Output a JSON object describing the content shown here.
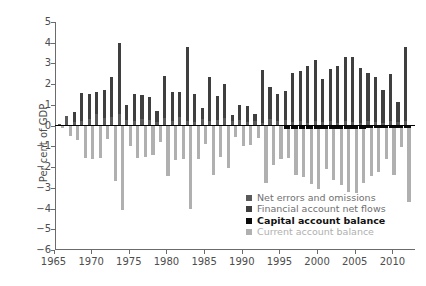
{
  "chart_data": {
    "type": "bar",
    "title": "",
    "xlabel": "",
    "ylabel": "Per cent of GDP",
    "ylim": [
      -6,
      5
    ],
    "xlim": [
      1965.2,
      2013.0
    ],
    "yticks": [
      5,
      4,
      3,
      2,
      1,
      0,
      -1,
      -2,
      -3,
      -4,
      -5,
      -6
    ],
    "ytick_labels": [
      "5",
      "4",
      "3",
      "2",
      "1",
      "0",
      "−1",
      "−2",
      "−3",
      "−4",
      "−5",
      "−6"
    ],
    "xticks": [
      1965,
      1970,
      1975,
      1980,
      1985,
      1990,
      1995,
      2000,
      2005,
      2010
    ],
    "xtick_labels": [
      "1965",
      "1970",
      "1975",
      "1980",
      "1985",
      "1990",
      "1995",
      "2000",
      "2005",
      "2010"
    ],
    "grid": false,
    "stacked": true,
    "legend_position": "lower right",
    "series": [
      {
        "name": "Net errors and omissions",
        "color": "#5a5a5a"
      },
      {
        "name": "Financial account net flows",
        "color": "#3f3f3f"
      },
      {
        "name": "Capital account balance",
        "color": "#0a0a0a"
      },
      {
        "name": "Current account balance",
        "color": "#b0b0b0"
      }
    ],
    "x": [
      1966,
      1967,
      1968,
      1969,
      1970,
      1971,
      1972,
      1973,
      1974,
      1975,
      1976,
      1977,
      1978,
      1979,
      1980,
      1981,
      1982,
      1983,
      1984,
      1985,
      1986,
      1987,
      1988,
      1989,
      1990,
      1991,
      1992,
      1993,
      1994,
      1995,
      1996,
      1997,
      1998,
      1999,
      2000,
      2001,
      2002,
      2003,
      2004,
      2005,
      2006,
      2007,
      2008,
      2009,
      2010,
      2011,
      2012
    ],
    "values": {
      "net_errors_and_omissions": [
        0.1,
        0.45,
        0.18,
        0.22,
        0.3,
        0.55,
        0.35,
        0.4,
        0.55,
        0.28,
        0.22,
        0.3,
        0.25,
        0.18,
        0.35,
        0.22,
        0.4,
        0.2,
        0.18,
        0.3,
        0.22,
        0.25,
        0.38,
        0.2,
        0.28,
        0.18,
        0.22,
        0.15,
        0.3,
        0.2,
        0.25,
        0.18,
        0.22,
        0.15,
        0.2,
        0.18,
        0.22,
        0.15,
        0.2,
        0.18,
        0.15,
        0.2,
        0.18,
        0.15,
        0.2,
        0.18,
        0.22
      ],
      "financial_account_net_flows": [
        0.0,
        0.0,
        0.48,
        1.35,
        1.25,
        1.05,
        1.35,
        1.95,
        3.45,
        0.7,
        1.3,
        1.2,
        1.15,
        0.55,
        2.05,
        1.4,
        1.2,
        3.6,
        1.35,
        0.55,
        2.15,
        1.2,
        1.65,
        0.3,
        0.7,
        0.75,
        0.35,
        2.55,
        1.55,
        1.35,
        1.4,
        2.35,
        2.4,
        2.75,
        2.95,
        2.05,
        2.5,
        2.75,
        3.1,
        3.15,
        2.65,
        2.35,
        2.15,
        1.55,
        2.3,
        0.95,
        3.55
      ],
      "capital_account_balance": [
        0.0,
        0.0,
        0.0,
        0.0,
        0.0,
        0.0,
        0.0,
        0.0,
        0.0,
        0.0,
        0.0,
        0.0,
        0.0,
        0.0,
        0.0,
        0.0,
        0.0,
        0.0,
        0.0,
        0.0,
        0.0,
        0.0,
        0.0,
        0.0,
        0.0,
        0.0,
        0.0,
        0.0,
        0.0,
        0.0,
        -0.18,
        -0.18,
        -0.16,
        -0.16,
        -0.16,
        -0.15,
        -0.15,
        -0.15,
        -0.14,
        -0.14,
        -0.14,
        -0.13,
        -0.13,
        -0.12,
        -0.12,
        -0.12,
        -0.12
      ],
      "current_account_balance": [
        -0.12,
        -0.5,
        -0.7,
        -1.55,
        -1.6,
        -1.55,
        -0.65,
        -2.65,
        -4.05,
        -1.0,
        -1.55,
        -1.5,
        -1.4,
        -0.8,
        -2.45,
        -1.65,
        -1.6,
        -4.0,
        -1.6,
        -0.9,
        -2.4,
        -1.5,
        -2.05,
        -0.55,
        -1.0,
        -0.95,
        -0.6,
        -2.75,
        -1.9,
        -1.6,
        -1.55,
        -2.4,
        -2.5,
        -2.8,
        -3.05,
        -2.1,
        -2.6,
        -2.85,
        -3.2,
        -3.25,
        -2.75,
        -2.45,
        -2.25,
        -1.6,
        -2.4,
        -1.05,
        -3.7
      ]
    }
  },
  "legend": {
    "items": [
      {
        "label": "Net errors and omissions",
        "color": "#5a5a5a",
        "emphasis": "normal"
      },
      {
        "label": "Financial account net flows",
        "color": "#3f3f3f",
        "emphasis": "normal"
      },
      {
        "label": "Capital account balance",
        "color": "#0a0a0a",
        "emphasis": "bold"
      },
      {
        "label": "Current account balance",
        "color": "#b0b0b0",
        "emphasis": "light"
      }
    ]
  }
}
